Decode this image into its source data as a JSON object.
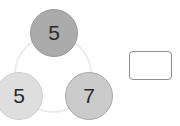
{
  "puzzle": {
    "nodes": {
      "top": {
        "value": "5",
        "color": "#ababab"
      },
      "bottom_left": {
        "value": "5",
        "color": "#dedede"
      },
      "bottom_right": {
        "value": "7",
        "color": "#cbcbcb"
      }
    },
    "ring_color": "#ececec",
    "answer_box": {
      "value": ""
    }
  }
}
